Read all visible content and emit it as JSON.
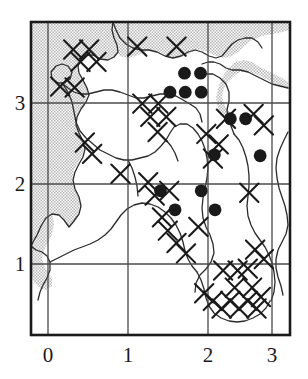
{
  "figure": {
    "name": "species-distribution-map",
    "type": "dot-distribution-map"
  },
  "chart_data": {
    "type": "scatter",
    "title": "",
    "xlabel": "",
    "ylabel": "",
    "xlim": [
      -0.28,
      3.28
    ],
    "ylim": [
      0.42,
      3.72
    ],
    "grid": true,
    "legend_position": "none",
    "xticks": [
      "0",
      "1",
      "2",
      "3"
    ],
    "yticks": [
      "1",
      "2",
      "3"
    ],
    "xtick_values": [
      0,
      1,
      2,
      3
    ],
    "ytick_values": [
      1,
      2,
      3
    ],
    "series": [
      {
        "name": "filled-circle-records",
        "marker": "filled-circle",
        "color": "#1a1a1a",
        "points": [
          [
            1.83,
            3.18
          ],
          [
            2.05,
            3.18
          ],
          [
            1.63,
            2.98
          ],
          [
            1.84,
            2.98
          ],
          [
            2.06,
            2.98
          ],
          [
            2.46,
            2.7
          ],
          [
            2.67,
            2.7
          ],
          [
            2.24,
            2.32
          ],
          [
            2.87,
            2.31
          ],
          [
            1.5,
            1.94
          ],
          [
            2.06,
            1.94
          ],
          [
            1.7,
            1.74
          ],
          [
            2.25,
            1.74
          ]
        ]
      },
      {
        "name": "cross-hatch-squares",
        "marker": "saltire-x",
        "color": "#1a1a1a",
        "points": [
          [
            0.3,
            3.43
          ],
          [
            0.52,
            3.43
          ],
          [
            0.4,
            3.3
          ],
          [
            0.62,
            3.3
          ],
          [
            1.18,
            3.46
          ],
          [
            1.72,
            3.46
          ],
          [
            0.12,
            3.04
          ],
          [
            0.32,
            3.03
          ],
          [
            1.25,
            2.86
          ],
          [
            1.47,
            2.86
          ],
          [
            1.36,
            2.72
          ],
          [
            1.58,
            2.72
          ],
          [
            1.46,
            2.56
          ],
          [
            0.46,
            2.45
          ],
          [
            0.56,
            2.33
          ],
          [
            2.13,
            2.54
          ],
          [
            2.3,
            2.43
          ],
          [
            2.22,
            2.28
          ],
          [
            2.4,
            2.7
          ],
          [
            2.78,
            2.75
          ],
          [
            2.92,
            2.63
          ],
          [
            1.33,
            2.03
          ],
          [
            1.42,
            1.89
          ],
          [
            1.62,
            1.94
          ],
          [
            0.95,
            2.12
          ],
          [
            1.52,
            1.66
          ],
          [
            1.6,
            1.52
          ],
          [
            1.72,
            1.39
          ],
          [
            1.85,
            1.28
          ],
          [
            2.02,
            1.56
          ],
          [
            2.72,
            1.92
          ],
          [
            2.8,
            1.32
          ],
          [
            2.92,
            1.22
          ],
          [
            2.36,
            1.1
          ],
          [
            2.56,
            1.1
          ],
          [
            2.7,
            1.12
          ],
          [
            2.1,
            0.86
          ],
          [
            2.22,
            0.78
          ],
          [
            2.34,
            0.7
          ],
          [
            2.46,
            0.78
          ],
          [
            2.58,
            0.7
          ],
          [
            2.7,
            0.78
          ],
          [
            2.82,
            0.7
          ],
          [
            2.52,
            0.92
          ],
          [
            2.76,
            0.92
          ],
          [
            2.88,
            0.82
          ]
        ]
      }
    ]
  },
  "axes": {
    "x": {
      "name": "x-axis",
      "ticks": [
        {
          "value": 0,
          "label": "0"
        },
        {
          "value": 1,
          "label": "1"
        },
        {
          "value": 2,
          "label": "2"
        },
        {
          "value": 3,
          "label": "3"
        }
      ]
    },
    "y": {
      "name": "y-axis",
      "ticks": [
        {
          "value": 1,
          "label": "1"
        },
        {
          "value": 2,
          "label": "2"
        },
        {
          "value": 3,
          "label": "3"
        }
      ]
    }
  },
  "labels": {
    "x0": "0",
    "x1": "1",
    "x2": "2",
    "x3": "3",
    "y1": "1",
    "y2": "2",
    "y3": "3"
  },
  "colors": {
    "frame": "#1a1a1a",
    "gridline": "#4a4a4a",
    "coastline": "#2b2b2b",
    "sea_shading": "#c9c9c9",
    "dot_fill": "#1a1a1a",
    "background": "#ffffff",
    "text": "#1a1a1a"
  }
}
